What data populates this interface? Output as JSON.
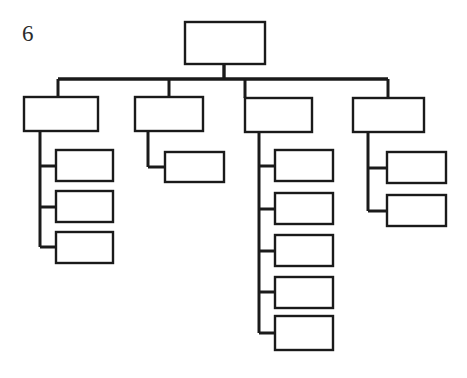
{
  "figure": {
    "label": "6",
    "label_x": 22,
    "label_y": 22,
    "label_font_size": 23
  },
  "canvas": {
    "width": 467,
    "height": 378,
    "background": "#ffffff"
  },
  "style": {
    "box_stroke": "#1a1a1a",
    "box_fill": "#ffffff",
    "box_stroke_width": 2.4,
    "line_stroke": "#1a1a1a",
    "line_width_trunk": 3.4,
    "line_width_branch": 3.0,
    "line_width_stub": 3.0
  },
  "chart_data": {
    "type": "diagram",
    "subtype": "organizational-chart",
    "title": "6",
    "orientation": "top-down with left-aligned sub-branches",
    "node_count": 16,
    "levels": 3,
    "nodes": [
      {
        "id": "root",
        "level": 1,
        "label": "",
        "x": 185,
        "y": 22,
        "w": 80,
        "h": 42
      },
      {
        "id": "b1",
        "level": 2,
        "label": "",
        "x": 24,
        "y": 97,
        "w": 74,
        "h": 34
      },
      {
        "id": "b2",
        "level": 2,
        "label": "",
        "x": 135,
        "y": 97,
        "w": 68,
        "h": 34
      },
      {
        "id": "b3",
        "level": 2,
        "label": "",
        "x": 245,
        "y": 98,
        "w": 67,
        "h": 34
      },
      {
        "id": "b4",
        "level": 2,
        "label": "",
        "x": 353,
        "y": 98,
        "w": 71,
        "h": 34
      },
      {
        "id": "b1c1",
        "level": 3,
        "parent": "b1",
        "label": "",
        "x": 56,
        "y": 150,
        "w": 57,
        "h": 31
      },
      {
        "id": "b1c2",
        "level": 3,
        "parent": "b1",
        "label": "",
        "x": 56,
        "y": 191,
        "w": 57,
        "h": 31
      },
      {
        "id": "b1c3",
        "level": 3,
        "parent": "b1",
        "label": "",
        "x": 56,
        "y": 232,
        "w": 57,
        "h": 31
      },
      {
        "id": "b2c1",
        "level": 3,
        "parent": "b2",
        "label": "",
        "x": 165,
        "y": 152,
        "w": 59,
        "h": 30
      },
      {
        "id": "b3c1",
        "level": 3,
        "parent": "b3",
        "label": "",
        "x": 275,
        "y": 150,
        "w": 58,
        "h": 31
      },
      {
        "id": "b3c2",
        "level": 3,
        "parent": "b3",
        "label": "",
        "x": 275,
        "y": 193,
        "w": 58,
        "h": 31
      },
      {
        "id": "b3c3",
        "level": 3,
        "parent": "b3",
        "label": "",
        "x": 275,
        "y": 235,
        "w": 58,
        "h": 31
      },
      {
        "id": "b3c4",
        "level": 3,
        "parent": "b3",
        "label": "",
        "x": 275,
        "y": 277,
        "w": 58,
        "h": 31
      },
      {
        "id": "b3c5",
        "level": 3,
        "parent": "b3",
        "label": "",
        "x": 275,
        "y": 316,
        "w": 58,
        "h": 34
      },
      {
        "id": "b4c1",
        "level": 3,
        "parent": "b4",
        "label": "",
        "x": 387,
        "y": 152,
        "w": 59,
        "h": 31
      },
      {
        "id": "b4c2",
        "level": 3,
        "parent": "b4",
        "label": "",
        "x": 387,
        "y": 195,
        "w": 59,
        "h": 31
      }
    ],
    "connectors": {
      "root_stem": {
        "x": 224,
        "y1": 64,
        "y2": 79
      },
      "bus": {
        "y": 79,
        "x1": 58,
        "x2": 388
      },
      "branch_drops": [
        {
          "node": "b1",
          "x": 58,
          "y1": 79,
          "y2": 97
        },
        {
          "node": "b2",
          "x": 169,
          "y1": 79,
          "y2": 97
        },
        {
          "node": "b3",
          "x": 245,
          "y1": 79,
          "y2": 98
        },
        {
          "node": "b4",
          "x": 388,
          "y1": 79,
          "y2": 98
        }
      ],
      "spines": [
        {
          "parent": "b1",
          "x": 40,
          "y1": 131,
          "y2": 247
        },
        {
          "parent": "b2",
          "x": 148,
          "y1": 131,
          "y2": 167
        },
        {
          "parent": "b3",
          "x": 259,
          "y1": 132,
          "y2": 333
        },
        {
          "parent": "b4",
          "x": 368,
          "y1": 132,
          "y2": 211
        }
      ],
      "stubs": [
        {
          "child": "b1c1",
          "y": 166,
          "x1": 40,
          "x2": 56
        },
        {
          "child": "b1c2",
          "y": 207,
          "x1": 40,
          "x2": 56
        },
        {
          "child": "b1c3",
          "y": 247,
          "x1": 40,
          "x2": 56
        },
        {
          "child": "b2c1",
          "y": 167,
          "x1": 148,
          "x2": 165
        },
        {
          "child": "b3c1",
          "y": 166,
          "x1": 259,
          "x2": 275
        },
        {
          "child": "b3c2",
          "y": 209,
          "x1": 259,
          "x2": 275
        },
        {
          "child": "b3c3",
          "y": 251,
          "x1": 259,
          "x2": 275
        },
        {
          "child": "b3c4",
          "y": 292,
          "x1": 259,
          "x2": 275
        },
        {
          "child": "b3c5",
          "y": 333,
          "x1": 259,
          "x2": 275
        },
        {
          "child": "b4c1",
          "y": 168,
          "x1": 368,
          "x2": 387
        },
        {
          "child": "b4c2",
          "y": 211,
          "x1": 368,
          "x2": 387
        }
      ]
    }
  }
}
